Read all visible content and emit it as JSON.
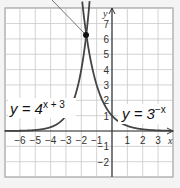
{
  "chart_data": {
    "type": "line",
    "title": "",
    "xlabel": "x",
    "ylabel": "y",
    "xlim": [
      -7,
      4
    ],
    "ylim": [
      -3,
      8
    ],
    "grid": true,
    "x_ticks": [
      -6,
      -5,
      -4,
      -3,
      -2,
      -1,
      1,
      2,
      3
    ],
    "y_ticks": [
      -2,
      -1,
      1,
      2,
      3,
      4,
      5,
      6,
      7
    ],
    "series": [
      {
        "name": "y = 4^(x+3)",
        "label_base": "y = 4",
        "label_exp": "x + 3",
        "function": "4^(x+3)"
      },
      {
        "name": "y = 3^(-x)",
        "label_base": "y = 3",
        "label_exp": "−x",
        "function": "3^(-x)"
      }
    ],
    "annotations": [
      {
        "type": "point",
        "label": "intersection",
        "x": -1.7,
        "y": 6.2
      },
      {
        "type": "leader-line",
        "to": "intersection"
      }
    ],
    "colors": {
      "curve": "#444444",
      "grid": "#c8c8c8",
      "axis": "#333333",
      "background": "#ffffff"
    }
  }
}
